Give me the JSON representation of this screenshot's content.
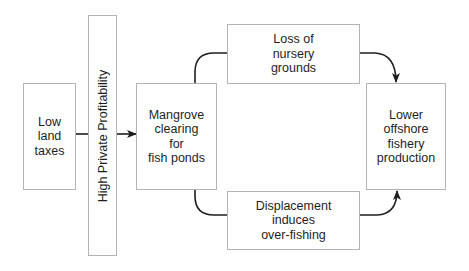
{
  "diagram": {
    "nodes": {
      "low_land_taxes": {
        "lines": [
          "Low",
          "land",
          "taxes"
        ]
      },
      "high_private_profitability": {
        "label": "High Private Profitability"
      },
      "mangrove_clearing": {
        "lines": [
          "Mangrove",
          "clearing",
          "for",
          "fish ponds"
        ]
      },
      "loss_of_nursery": {
        "lines": [
          "Loss of",
          "nursery",
          "grounds"
        ]
      },
      "displacement": {
        "lines": [
          "Displacement",
          "induces",
          "over-fishing"
        ]
      },
      "lower_offshore": {
        "lines": [
          "Lower",
          "offshore",
          "fishery",
          "production"
        ]
      }
    },
    "edges": [
      {
        "from": "low_land_taxes",
        "to": "high_private_profitability",
        "arrow": false
      },
      {
        "from": "high_private_profitability",
        "to": "mangrove_clearing",
        "arrow": true
      },
      {
        "from": "mangrove_clearing",
        "to": "loss_of_nursery",
        "arrow": false
      },
      {
        "from": "mangrove_clearing",
        "to": "displacement",
        "arrow": false
      },
      {
        "from": "loss_of_nursery",
        "to": "lower_offshore",
        "arrow": true
      },
      {
        "from": "displacement",
        "to": "lower_offshore",
        "arrow": true
      }
    ],
    "colors": {
      "line": "#1e1e1e",
      "border": "#b4b4b4",
      "background": "#ffffff"
    }
  }
}
